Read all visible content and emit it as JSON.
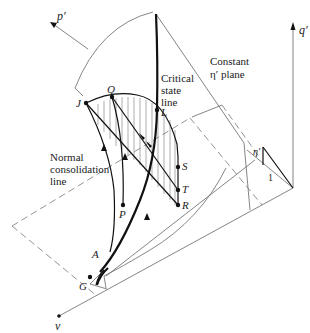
{
  "figure": {
    "type": "3d-state-boundary-surface",
    "axes": {
      "p": {
        "label": "p′"
      },
      "q": {
        "label": "q′"
      },
      "v": {
        "label": "v"
      }
    },
    "annotations": {
      "constant_plane": {
        "line1": "Constant",
        "line2": "η′ plane"
      },
      "critical_state": {
        "line1": "Critical",
        "line2": "state",
        "line3": "line"
      },
      "ncl": {
        "line1": "Normal",
        "line2": "consolidation",
        "line3": "line"
      },
      "slope_eta": "η′",
      "slope_one": "1"
    },
    "points": {
      "J": "J",
      "Q": "Q",
      "L": "L",
      "S": "S",
      "T": "T",
      "R": "R",
      "P": "P",
      "A": "A",
      "G": "G"
    },
    "colors": {
      "ink": "#111111",
      "thin_line": "#666666",
      "background": "#ffffff"
    }
  }
}
